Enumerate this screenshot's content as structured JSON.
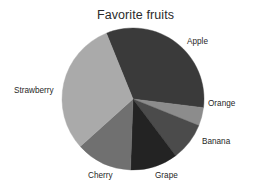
{
  "chart_data": {
    "type": "pie",
    "title": "Favorite fruits",
    "xlabel": "",
    "ylabel": "",
    "legend_position": "none",
    "labels_position": "outside",
    "grid": false,
    "start_angle_deg": -22,
    "direction": "clockwise",
    "center": {
      "x": 133,
      "y": 99
    },
    "radius": 71,
    "categories": [
      "Apple",
      "Orange",
      "Banana",
      "Grape",
      "Cherry",
      "Strawberry"
    ],
    "values": [
      33,
      4,
      9,
      11,
      13,
      30
    ],
    "slices": [
      {
        "label": "Apple",
        "value": 33,
        "color": "#3a3a3a",
        "start_deg": -22,
        "end_deg": 97,
        "label_x": 187,
        "label_y": 38
      },
      {
        "label": "Orange",
        "value": 4,
        "color": "#8c8c8c",
        "start_deg": 97,
        "end_deg": 112,
        "label_x": 208,
        "label_y": 100
      },
      {
        "label": "Banana",
        "value": 9,
        "color": "#4b4b4b",
        "start_deg": 112,
        "end_deg": 143,
        "label_x": 202,
        "label_y": 138
      },
      {
        "label": "Grape",
        "value": 11,
        "color": "#232323",
        "start_deg": 143,
        "end_deg": 182,
        "label_x": 155,
        "label_y": 172
      },
      {
        "label": "Cherry",
        "value": 13,
        "color": "#707070",
        "start_deg": 182,
        "end_deg": 228,
        "label_x": 88,
        "label_y": 172
      },
      {
        "label": "Strawberry",
        "value": 30,
        "color": "#aaaaaa",
        "start_deg": 228,
        "end_deg": 338,
        "label_x": 14,
        "label_y": 87
      }
    ]
  },
  "colors": {
    "background": "#ffffff",
    "text": "#1f1f1f",
    "title": "#2b2b2b",
    "apple": "#3a3a3a",
    "orange": "#8c8c8c",
    "banana": "#4b4b4b",
    "grape": "#232323",
    "cherry": "#707070",
    "strawberry": "#aaaaaa"
  }
}
